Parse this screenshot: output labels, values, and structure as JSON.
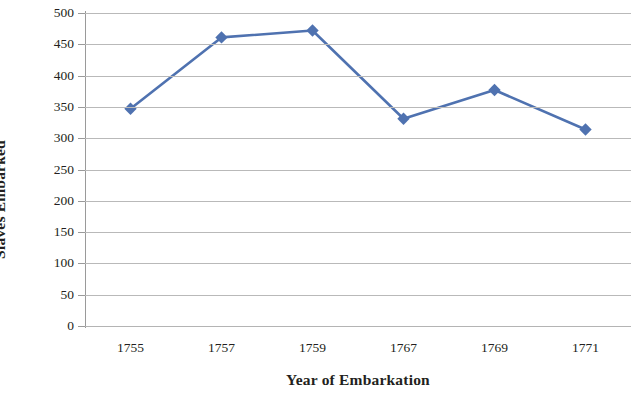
{
  "chart_data": {
    "type": "line",
    "title": "",
    "xlabel": "Year of Embarkation",
    "ylabel": "Slaves Embarked",
    "categories": [
      "1755",
      "1757",
      "1759",
      "1767",
      "1769",
      "1771"
    ],
    "values": [
      347,
      461,
      472,
      331,
      377,
      314
    ],
    "series": [
      {
        "name": "Slaves Embarked",
        "values": [
          347,
          461,
          472,
          331,
          377,
          314
        ],
        "color": "#4f72b0",
        "marker": "diamond",
        "marker_color": "#4f72b0"
      }
    ],
    "ylim": [
      0,
      500
    ],
    "yticks": [
      0,
      50,
      100,
      150,
      200,
      250,
      300,
      350,
      400,
      450,
      500
    ],
    "ytick_labels": [
      "0",
      "50",
      "100",
      "150",
      "200",
      "250",
      "300",
      "350",
      "400",
      "450",
      "500"
    ],
    "grid": "horizontal",
    "legend": "none",
    "colors": {
      "line": "#4f72b0",
      "marker": "#4f72b0",
      "gridline": "#b9b9b9",
      "axis": "#9a9a9a",
      "text": "#231f20",
      "background": "#ffffff"
    }
  }
}
